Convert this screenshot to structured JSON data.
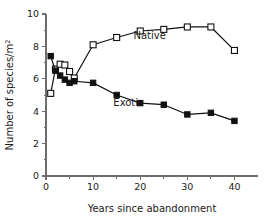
{
  "chart_data": {
    "type": "line",
    "title": "",
    "xlabel": "Years since abandonment",
    "ylabel": "Number of species/m",
    "ylabel_superscript": "2",
    "xlim": [
      0,
      45
    ],
    "ylim": [
      0,
      10
    ],
    "grid": false,
    "legend_position": "inline-annotations",
    "x_ticks": [
      0,
      10,
      20,
      30,
      40
    ],
    "x_tick_labels": [
      "0",
      "10",
      "20",
      "30",
      "40"
    ],
    "x_minor_ticks": [
      5,
      15,
      25,
      35
    ],
    "y_ticks": [
      0,
      2,
      4,
      6,
      8,
      10
    ],
    "y_tick_labels": [
      "0",
      "2",
      "4",
      "6",
      "8",
      "10"
    ],
    "y_minor_ticks": [
      1,
      3,
      5,
      7,
      9
    ],
    "series": [
      {
        "name": "Native",
        "marker": "open-square",
        "label_x": 22,
        "label_y": 8.45,
        "x": [
          1,
          2,
          3,
          4,
          5,
          6,
          10,
          15,
          20,
          25,
          30,
          35,
          40
        ],
        "values": [
          5.1,
          6.6,
          6.9,
          6.85,
          6.45,
          6.05,
          8.1,
          8.55,
          8.95,
          9.05,
          9.2,
          9.2,
          7.75
        ]
      },
      {
        "name": "Exotic",
        "marker": "filled-square",
        "label_x": 17.5,
        "label_y": 4.35,
        "x": [
          1,
          2,
          3,
          4,
          5,
          6,
          10,
          15,
          20,
          25,
          30,
          35,
          40
        ],
        "values": [
          7.4,
          6.5,
          6.2,
          5.95,
          5.75,
          5.85,
          5.75,
          5.0,
          4.5,
          4.4,
          3.8,
          3.9,
          3.4
        ]
      }
    ]
  }
}
